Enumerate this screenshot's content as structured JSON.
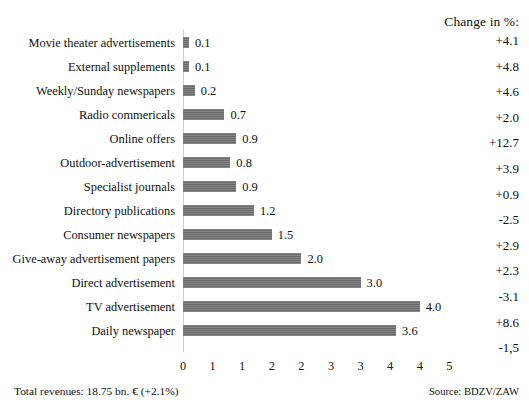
{
  "header": {
    "change_column_title": "Change in %:"
  },
  "footer": {
    "total_revenues": "Total revenues: 18.75 bn. € (+2.1%)",
    "source": "Source: BDZV/ZAW"
  },
  "chart_data": {
    "type": "bar",
    "orientation": "horizontal",
    "title": "",
    "xlabel": "",
    "ylabel": "",
    "xlim": [
      0,
      5
    ],
    "grid": false,
    "legend": null,
    "tick_labels": [
      "0",
      "1",
      "1",
      "2",
      "2",
      "3",
      "3",
      "4",
      "4",
      "5"
    ],
    "tick_values": [
      0,
      0.5,
      1.0,
      1.5,
      2.0,
      2.5,
      3.0,
      3.5,
      4.0,
      4.5
    ],
    "bar_color": "#6f6f6f",
    "categories": [
      "Movie theater advertisements",
      "External supplements",
      "Weekly/Sunday newspapers",
      "Radio commericals",
      "Online offers",
      "Outdoor-advertisement",
      "Specialist journals",
      "Directory publications",
      "Consumer newspapers",
      "Give-away advertisement papers",
      "Direct advertisement",
      "TV advertisement",
      "Daily newspaper"
    ],
    "values": [
      0.1,
      0.1,
      0.2,
      0.7,
      0.9,
      0.8,
      0.9,
      1.2,
      1.5,
      2.0,
      3.0,
      4.0,
      3.6
    ],
    "value_labels": [
      "0.1",
      "0.1",
      "0.2",
      "0.7",
      "0.9",
      "0.8",
      "0.9",
      "1.2",
      "1.5",
      "2.0",
      "3.0",
      "4.0",
      "3.6"
    ],
    "change_labels": [
      "+4.1",
      "+4.8",
      "+4.6",
      "+2.0",
      "+12.7",
      "+3.9",
      "+0.9",
      "-2.5",
      "+2.9",
      "+2.3",
      "-3.1",
      "+8.6",
      "-1,5"
    ]
  }
}
